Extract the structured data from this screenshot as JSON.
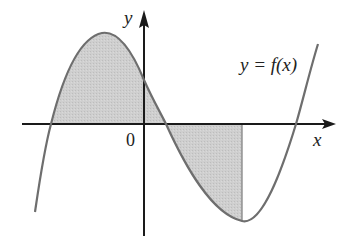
{
  "diagram": {
    "type": "function-graph",
    "axes": {
      "x_label": "x",
      "y_label": "y",
      "origin_label": "0"
    },
    "curve": {
      "label": "y = f(x)",
      "kind": "cubic",
      "color": "#6e6e6e"
    },
    "shaded_region": {
      "description": "Area between curve and x-axis from left root to local minimum",
      "color": "#c8c8c8"
    },
    "colors": {
      "axis": "#1a1a1a",
      "curve": "#6e6e6e",
      "shade": "#cdcdcd",
      "text": "#222222"
    }
  }
}
